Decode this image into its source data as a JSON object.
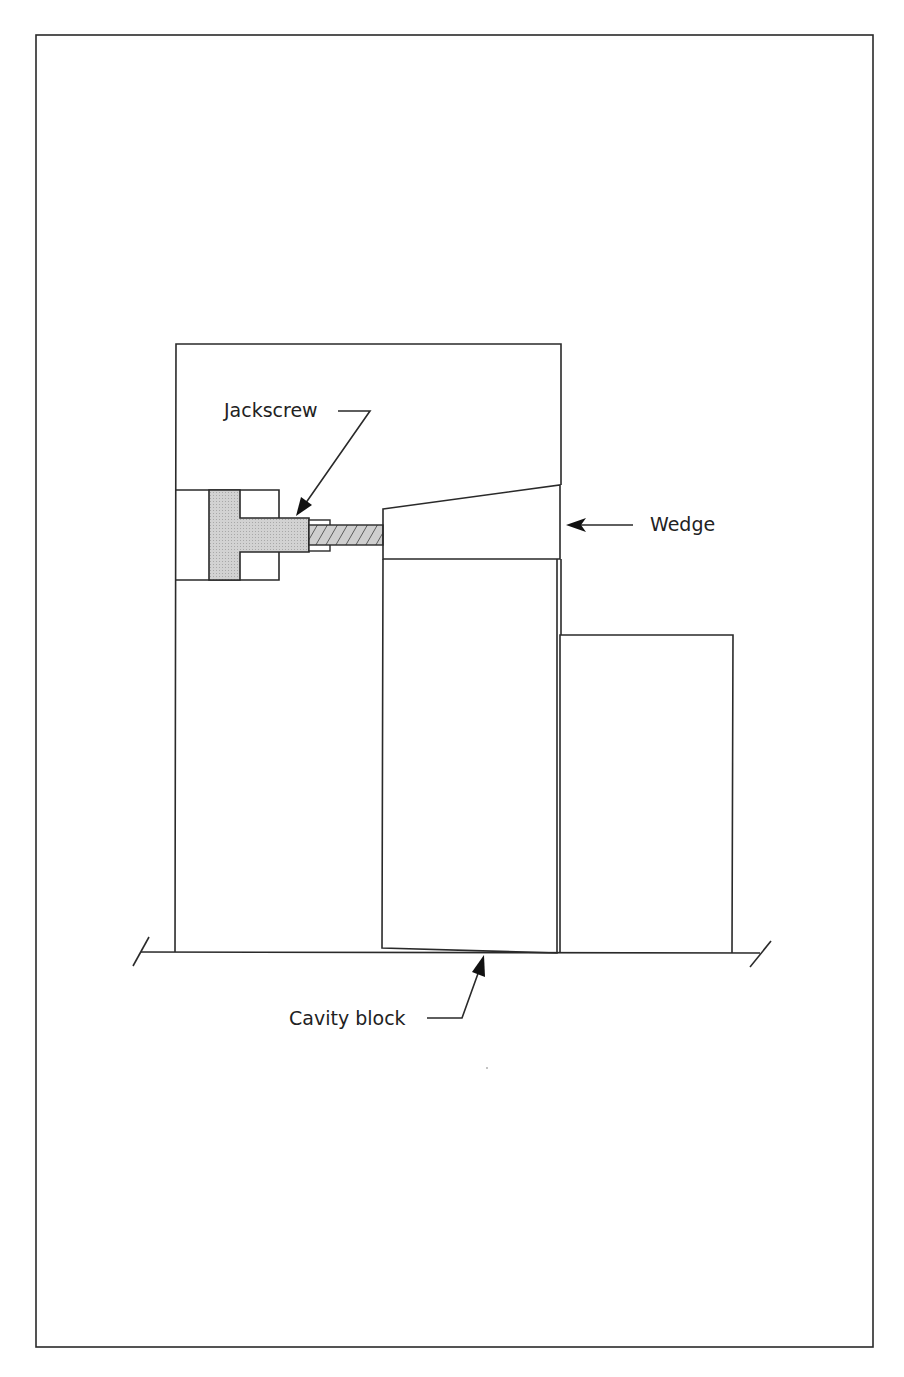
{
  "diagram": {
    "type": "mechanical cross-section",
    "colors": {
      "line": "#2a2a2a",
      "fill_jackscrew": "#cfcfcf",
      "background": "#ffffff"
    },
    "labels": {
      "jackscrew": "Jackscrew",
      "wedge": "Wedge",
      "cavity_block": "Cavity block"
    },
    "components": [
      {
        "name": "Jackscrew",
        "description": "T-head screw in a pocket of the left block, threaded rod pushing on the wedge"
      },
      {
        "name": "Wedge",
        "description": "Tapered block between left block and center block"
      },
      {
        "name": "Cavity block",
        "description": "Center block sitting on the base, slightly tilted at its bottom"
      }
    ]
  }
}
